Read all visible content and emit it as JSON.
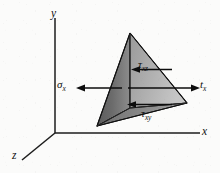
{
  "figure": {
    "type": "stress-tetrahedron-diagram",
    "background_color": "#fbfbfa",
    "ink_color": "#111111"
  },
  "axes": {
    "y": {
      "label": "y",
      "origin": [
        55,
        133
      ],
      "tip": [
        55,
        18
      ]
    },
    "x": {
      "label": "x",
      "origin": [
        55,
        133
      ],
      "tip": [
        200,
        133
      ]
    },
    "z": {
      "label": "z",
      "origin": [
        55,
        133
      ],
      "tip": [
        22,
        160
      ]
    }
  },
  "tetrahedron": {
    "apex": [
      130,
      33
    ],
    "bottom_left": [
      97,
      126
    ],
    "right": [
      187,
      103
    ],
    "inner": [
      130,
      108
    ],
    "face_front_fill": "#6e6e6e",
    "face_right_fill": "#a8a8a8",
    "face_bottom_fill": "#8a8a8a",
    "edge_color": "#101010"
  },
  "vectors": [
    {
      "name": "sigma-x",
      "label": "σ",
      "subscript": "x",
      "direction": "left",
      "from": [
        120,
        88
      ],
      "to": [
        78,
        88
      ]
    },
    {
      "name": "t-x",
      "label": "t",
      "subscript": "x",
      "direction": "right",
      "from": [
        128,
        88
      ],
      "to": [
        199,
        88
      ]
    },
    {
      "name": "tau-xz",
      "label": "τ",
      "subscript": "xz",
      "direction": "left",
      "from": [
        172,
        69
      ],
      "to": [
        133,
        69
      ]
    },
    {
      "name": "tau-xy",
      "label": "τ",
      "subscript": "xy",
      "direction": "left",
      "from": [
        172,
        105
      ],
      "to": [
        128,
        105
      ]
    }
  ],
  "labels": {
    "axis_y": "y",
    "axis_x": "x",
    "axis_z": "z",
    "sigma_x_base": "σ",
    "sigma_x_sub": "x",
    "t_x_base": "t",
    "t_x_sub": "x",
    "tau_xz_base": "τ",
    "tau_xz_sub": "xz",
    "tau_xy_base": "τ",
    "tau_xy_sub": "xy"
  }
}
